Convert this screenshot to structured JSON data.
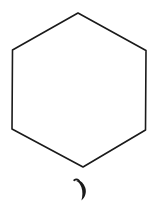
{
  "image": {
    "title": "Hand-drawn hexagon with crescent mark",
    "background_color": "#ffffff",
    "ink_color": "#1a1a1a",
    "width": 160,
    "height": 212,
    "style": "monochrome hand-drawn line sketch, no text"
  },
  "shapes": [
    {
      "name": "hexagon",
      "type": "polygon",
      "sides": 6,
      "stroke_width": 1.6,
      "fill": "none",
      "vertices": [
        {
          "x": 78,
          "y": 13
        },
        {
          "x": 146,
          "y": 50
        },
        {
          "x": 146,
          "y": 130
        },
        {
          "x": 83,
          "y": 167
        },
        {
          "x": 12,
          "y": 129
        },
        {
          "x": 12,
          "y": 50
        }
      ],
      "path": "M 78 13 L 146 50.5 L 145.5 130 L 83 167 L 12 129 L 12.5 50 Z"
    },
    {
      "name": "crescent-mark",
      "type": "crescent",
      "stroke_width": 1.4,
      "fill": "#1a1a1a",
      "bounding_box": {
        "x": 74,
        "y": 179,
        "width": 13,
        "height": 22
      },
      "outer_path": "M 76.2 181.0 C 79.8 179.2 83.6 183.0 85.2 187.6 C 86.9 192.6 85.0 197.6 81.4 200.6 C 82.6 196.2 82.9 191.4 81.4 187.2 C 80.2 183.8 78.3 181.8 76.2 181.0 Z",
      "hook_path": "M 74.2 180.2 C 75.6 179.2 77.6 179.4 79.0 180.6"
    }
  ],
  "annotations": {
    "has_text": false,
    "text_items": []
  }
}
